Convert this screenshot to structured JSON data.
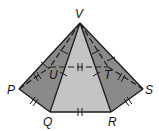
{
  "figure": {
    "type": "hexagonal-pyramid",
    "apex_label": "V",
    "vertex_labels": {
      "P": "P",
      "Q": "Q",
      "R": "R",
      "S": "S",
      "T": "T",
      "U": "U",
      "V": "V"
    },
    "colors": {
      "dark_face": "#8a8a8a",
      "light_face": "#c4c4c4",
      "edge": "#1a1a1a",
      "background": "#ffffff"
    },
    "tick_marks": {
      "base_edges": "double tick (congruent)",
      "lateral_edges": "single tick (congruent)"
    }
  }
}
